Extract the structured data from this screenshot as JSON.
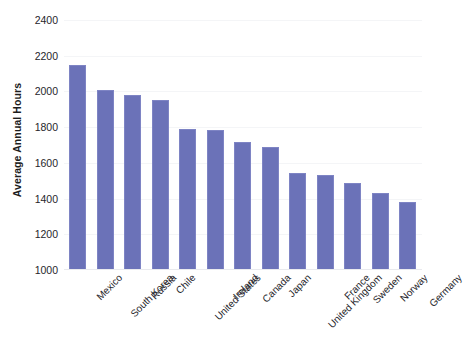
{
  "chart_data": {
    "type": "bar",
    "title": "",
    "xlabel": "",
    "ylabel": "Average Annual Hours",
    "ylim": [
      1000,
      2400
    ],
    "ytick_step": 200,
    "yticks": [
      "2400",
      "2200",
      "2000",
      "1800",
      "1600",
      "1400",
      "1200",
      "1000"
    ],
    "grid": true,
    "legend": "none",
    "bar_color": "#6b72b8",
    "categories": [
      "Mexico",
      "South Korea",
      "Russia",
      "Chile",
      "United States",
      "Ireland",
      "Canada",
      "Japan",
      "United Kingdom",
      "France",
      "Sweden",
      "Norway",
      "Germany"
    ],
    "values": [
      2150,
      2010,
      1980,
      1950,
      1790,
      1785,
      1715,
      1690,
      1545,
      1530,
      1485,
      1430,
      1380
    ]
  }
}
